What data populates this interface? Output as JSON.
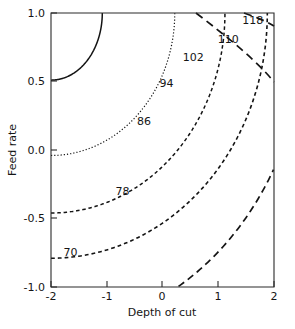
{
  "chart_data": {
    "type": "line",
    "title": "",
    "xlabel": "Depth of cut",
    "ylabel": "Feed rate",
    "xlim": [
      -2,
      2
    ],
    "ylim": [
      -1,
      1
    ],
    "xticks": [
      -2,
      -1,
      0,
      1,
      2
    ],
    "xticklabels": [
      "-2",
      "-1",
      "0",
      "1",
      "2"
    ],
    "yticks": [
      -1.0,
      -0.5,
      0.0,
      0.5,
      1.0
    ],
    "yticklabels": [
      "-1.0",
      "-0.5",
      "0.0",
      "0.5",
      "1.0"
    ],
    "grid": false,
    "legend": "none",
    "contour_origin": [
      -2,
      1
    ],
    "contours": [
      {
        "level": 70,
        "label": "70",
        "style": "solid",
        "dasharray": "none",
        "stroke_width": 1.5,
        "label_x": -1.65,
        "label_y": -0.77,
        "rx": 0.92,
        "ry": 0.49,
        "crossings": {
          "left_y": -0.59,
          "bottom_x": -1.1
        }
      },
      {
        "level": 78,
        "label": "78",
        "style": "dotted",
        "dasharray": "1.2 2.0",
        "stroke_width": 1.2,
        "label_x": -0.72,
        "label_y": -0.33,
        "rx": 2.22,
        "ry": 1.04,
        "crossings": {
          "left_y": 0.04,
          "bottom_x": 0.22
        }
      },
      {
        "level": 86,
        "label": "86",
        "style": "dashed-short",
        "dasharray": "3.5 2.8",
        "stroke_width": 1.5,
        "label_x": -0.33,
        "label_y": 0.18,
        "rx": 3.12,
        "ry": 1.46,
        "crossings": {
          "left_y": 0.46,
          "bottom_x": 1.12
        }
      },
      {
        "level": 94,
        "label": "94",
        "style": "dashed-short",
        "dasharray": "3.8 3.0",
        "stroke_width": 1.6,
        "label_x": 0.07,
        "label_y": 0.46,
        "rx": 3.88,
        "ry": 1.79,
        "crossings": {
          "left_y": 0.8,
          "bottom_x": 1.88
        }
      },
      {
        "level": 102,
        "label": "102",
        "style": "dashed-long",
        "dasharray": "7.0 4.5",
        "stroke_width": 1.7,
        "label_x": 0.55,
        "label_y": 0.65,
        "rx": 4.6,
        "ry": 2.3,
        "crossings": {
          "top_x": -0.38,
          "right_y": 0.05
        }
      },
      {
        "level": 110,
        "label": "110",
        "style": "dashed-long",
        "dasharray": "8.0 5.0",
        "stroke_width": 1.7,
        "label_x": 1.18,
        "label_y": 0.78,
        "rx": 5.6,
        "ry": 2.9,
        "crossings": {
          "top_x": 0.82,
          "right_y": 0.55
        }
      },
      {
        "level": 118,
        "label": "118",
        "style": "dashed-long",
        "dasharray": "8.0 5.0",
        "stroke_width": 1.7,
        "label_x": 1.62,
        "label_y": 0.92,
        "rx": 6.4,
        "ry": 3.5,
        "crossings": {
          "top_x": 1.68,
          "right_y": 0.88
        }
      }
    ]
  },
  "axes": {
    "x_title": "Depth of cut",
    "y_title": "Feed rate",
    "x_tick_labels": [
      "-2",
      "-1",
      "0",
      "1",
      "2"
    ],
    "y_tick_labels": [
      "1.0",
      "0.5",
      "0.0",
      "-0.5",
      "-1.0"
    ]
  },
  "contour_labels": {
    "l70": "70",
    "l78": "78",
    "l86": "86",
    "l94": "94",
    "l102": "102",
    "l110": "110",
    "l118": "118"
  },
  "colors": {
    "line": "#141414",
    "frame": "#2a2a2a",
    "text": "#151515",
    "background": "#ffffff"
  }
}
